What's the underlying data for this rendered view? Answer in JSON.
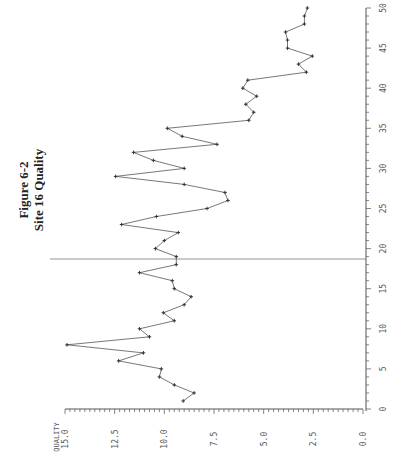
{
  "title": {
    "line1": "Figure 6-2",
    "line2": "Site 16 Quality"
  },
  "chart_data": {
    "type": "line",
    "title": "Figure 6-2 Site 16 Quality",
    "orientation": "rotated-90-ccw",
    "xlabel": "",
    "ylabel": "QUALITY",
    "xlim": [
      0,
      50
    ],
    "ylim": [
      0,
      15
    ],
    "x_ticks": [
      0,
      5,
      10,
      15,
      20,
      25,
      30,
      35,
      40,
      45,
      50
    ],
    "x_tick_labels": [
      "0",
      "5",
      "10",
      "15",
      "20",
      "25",
      "30",
      "35",
      "40",
      "45",
      "50"
    ],
    "y_ticks": [
      15,
      12.5,
      10,
      7.5,
      5,
      2.5,
      0
    ],
    "y_tick_labels": [
      "15.0",
      "12.5",
      "10.0",
      "7.5",
      "5.0",
      "2.5",
      "0.0"
    ],
    "grid": false,
    "legend": null,
    "reference_line_x": 18.7,
    "series": [
      {
        "name": "Quality",
        "x": [
          1,
          2,
          3,
          4,
          5,
          6,
          7,
          8,
          9,
          10,
          11,
          12,
          13,
          14,
          15,
          16,
          17,
          18,
          19,
          20,
          21,
          22,
          23,
          24,
          25,
          26,
          27,
          28,
          29,
          30,
          31,
          32,
          33,
          34,
          35,
          36,
          37,
          38,
          39,
          40,
          41,
          42,
          43,
          44,
          45,
          46,
          47,
          48,
          49,
          50
        ],
        "values": [
          9.05,
          8.5,
          9.5,
          10.25,
          10.15,
          12.3,
          11.05,
          14.9,
          10.75,
          11.25,
          9.5,
          10.05,
          9.0,
          8.65,
          9.5,
          9.6,
          11.25,
          9.4,
          9.4,
          10.45,
          10.0,
          9.3,
          12.15,
          10.4,
          7.85,
          6.8,
          6.95,
          9.0,
          12.45,
          9.0,
          10.55,
          11.55,
          7.35,
          9.1,
          9.85,
          5.75,
          5.5,
          5.9,
          5.35,
          6.05,
          5.8,
          2.85,
          3.25,
          2.55,
          3.8,
          3.8,
          3.9,
          2.95,
          2.95,
          2.8
        ]
      }
    ]
  }
}
